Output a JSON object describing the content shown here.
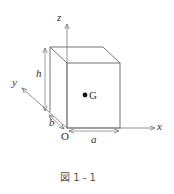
{
  "figure": {
    "caption": "図 1 - 1",
    "labels": {
      "z_axis": "z",
      "y_axis": "y",
      "x_axis": "x",
      "origin": "O",
      "height": "h",
      "depth": "b",
      "width": "a",
      "center_of_gravity": "G"
    },
    "colors": {
      "line": "#666666",
      "text": "#333333",
      "dot": "#111111"
    }
  }
}
